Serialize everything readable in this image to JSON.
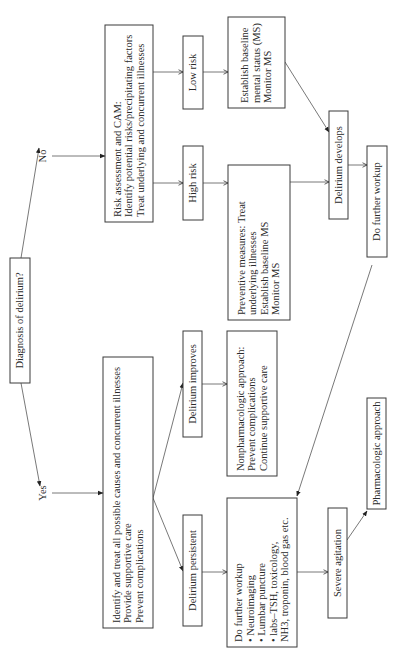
{
  "diagram": {
    "orientation": "rotated-90-ccw",
    "nodes": {
      "diagnosis": {
        "lines": [
          "Diagnosis of delirium?"
        ]
      },
      "risk_assessment": {
        "lines": [
          "Risk assessment and CAM:",
          "Identify potential risks/precipitating factors",
          "Treat underlying and concurrent illnesses"
        ]
      },
      "low_risk": {
        "lines": [
          "Low risk"
        ]
      },
      "high_risk": {
        "lines": [
          "High risk"
        ]
      },
      "establish_baseline": {
        "lines": [
          "Establish baseline",
          "mental status (MS)",
          "Monitor MS"
        ]
      },
      "preventive": {
        "lines": [
          "Preventive measures: Treat",
          "underlying illnesses",
          "Establish baseline MS",
          "Monitor MS"
        ]
      },
      "delirium_develops": {
        "lines": [
          "Delirium develops"
        ]
      },
      "further_workup_top": {
        "lines": [
          "Do further workup"
        ]
      },
      "identify_treat": {
        "lines": [
          "Identify and treat all possible causes and concurrent illnesses",
          "Provide supportive care",
          "Prevent complications"
        ]
      },
      "delirium_improves": {
        "lines": [
          "Delirium improves"
        ]
      },
      "nonpharm": {
        "lines": [
          "Nonpharmacologic approach:",
          "Prevent complications",
          "Continue supportive care"
        ]
      },
      "delirium_persistent": {
        "lines": [
          "Delirium persistent"
        ]
      },
      "further_workup_list": {
        "lines": [
          "Do further workup",
          "• Neuroimaging",
          "• Lumbar puncture",
          "• labs–TSH, toxicology,",
          "   NH3, troponin, blood gas etc."
        ]
      },
      "severe_agitation": {
        "lines": [
          "Severe agitation"
        ]
      },
      "pharmacologic": {
        "lines": [
          "Pharmacologic approach"
        ]
      }
    },
    "edge_labels": {
      "no": "No",
      "yes": "Yes"
    },
    "edges": [
      {
        "from": "diagnosis",
        "to": "risk_assessment",
        "label": "No"
      },
      {
        "from": "diagnosis",
        "to": "identify_treat",
        "label": "Yes"
      },
      {
        "from": "risk_assessment",
        "to": "low_risk"
      },
      {
        "from": "risk_assessment",
        "to": "high_risk"
      },
      {
        "from": "low_risk",
        "to": "establish_baseline"
      },
      {
        "from": "high_risk",
        "to": "preventive"
      },
      {
        "from": "establish_baseline",
        "to": "delirium_develops"
      },
      {
        "from": "preventive",
        "to": "delirium_develops"
      },
      {
        "from": "delirium_develops",
        "to": "further_workup_top"
      },
      {
        "from": "further_workup_top",
        "to": "further_workup_list"
      },
      {
        "from": "identify_treat",
        "to": "delirium_improves"
      },
      {
        "from": "identify_treat",
        "to": "delirium_persistent"
      },
      {
        "from": "delirium_improves",
        "to": "nonpharm"
      },
      {
        "from": "delirium_persistent",
        "to": "further_workup_list"
      },
      {
        "from": "further_workup_list",
        "to": "severe_agitation"
      },
      {
        "from": "severe_agitation",
        "to": "pharmacologic"
      }
    ]
  }
}
